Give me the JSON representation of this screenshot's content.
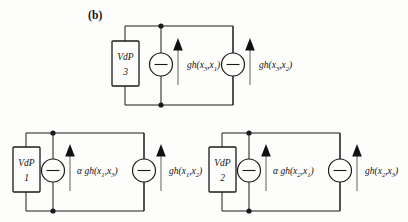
{
  "figure": {
    "panel_label": "(b)",
    "type": "circuit-diagram"
  },
  "symbols": {
    "gh": "gh",
    "alpha": "α",
    "x": "x",
    "source_glyph": "—",
    "arrow_glyph": "↑"
  },
  "circuits": [
    {
      "id": "vdp3",
      "box_line1": "VdP",
      "box_line2": "3",
      "sources": [
        {
          "prefix": "",
          "func": "gh",
          "arg1_base": "x",
          "arg1_sub": "3",
          "arg2_base": "x",
          "arg2_sub": "1",
          "text": "gh(x3,x1)"
        },
        {
          "prefix": "",
          "func": "gh",
          "arg1_base": "x",
          "arg1_sub": "3",
          "arg2_base": "x",
          "arg2_sub": "2",
          "text": "gh(x3,x2)"
        }
      ]
    },
    {
      "id": "vdp1",
      "box_line1": "VdP",
      "box_line2": "1",
      "sources": [
        {
          "prefix": "α",
          "func": "gh",
          "arg1_base": "x",
          "arg1_sub": "1",
          "arg2_base": "x",
          "arg2_sub": "3",
          "text": "α gh(x1,x3)"
        },
        {
          "prefix": "",
          "func": "gh",
          "arg1_base": "x",
          "arg1_sub": "1",
          "arg2_base": "x",
          "arg2_sub": "2",
          "text": "gh(x1,x2)"
        }
      ]
    },
    {
      "id": "vdp2",
      "box_line1": "VdP",
      "box_line2": "2",
      "sources": [
        {
          "prefix": "α",
          "func": "gh",
          "arg1_base": "x",
          "arg1_sub": "2",
          "arg2_base": "x",
          "arg2_sub": "1",
          "text": "α gh(x2,x1)"
        },
        {
          "prefix": "",
          "func": "gh",
          "arg1_base": "x",
          "arg1_sub": "2",
          "arg2_base": "x",
          "arg2_sub": "3",
          "text": "gh(x2,x3)"
        }
      ]
    }
  ],
  "colors": {
    "ink": "#1a1a1a",
    "background": "#fdfdfb",
    "arrow": "#6f6f6f"
  }
}
